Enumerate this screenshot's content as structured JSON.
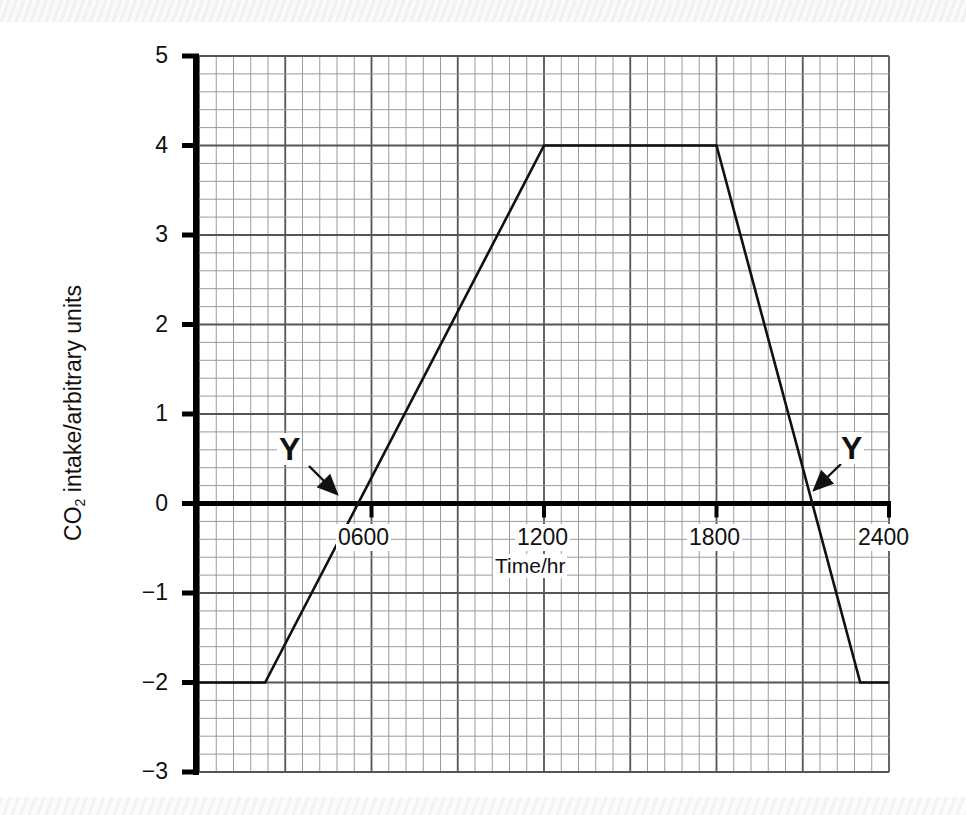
{
  "chart_data": {
    "type": "line",
    "title": "",
    "xlabel": "Time/hr",
    "ylabel": "CO2 intake/arbitrary units",
    "ylabel_main": "CO",
    "ylabel_sub": "2",
    "ylabel_rest": " intake/arbitrary units",
    "x_ticks": [
      "0600",
      "1200",
      "1800",
      "2400"
    ],
    "y_ticks": [
      "5",
      "4",
      "3",
      "2",
      "1",
      "0",
      "−1",
      "−2",
      "−3"
    ],
    "xlim": [
      0,
      2400
    ],
    "ylim": [
      -3,
      5
    ],
    "grid": true,
    "grid_minor": {
      "x_step_hr": 60,
      "y_step": 0.2
    },
    "grid_major": {
      "x_step_hr": 300,
      "y_step": 1
    },
    "series": [
      {
        "name": "CO2 intake",
        "x": [
          0,
          230,
          1200,
          1800,
          2300,
          2400
        ],
        "y": [
          -2,
          -2,
          4,
          4,
          -2,
          -2
        ]
      }
    ],
    "annotations": [
      {
        "label": "Y",
        "points_to": {
          "x": 500,
          "y": 0
        },
        "description": "compensation point (morning)"
      },
      {
        "label": "Y",
        "points_to": {
          "x": 2110,
          "y": 0
        },
        "description": "compensation point (evening)"
      }
    ],
    "colors": {
      "line": "#111111",
      "grid_minor": "#9a9a9a",
      "grid_major": "#555555",
      "axis": "#000000"
    }
  },
  "labels": {
    "y_ticks": [
      "5",
      "4",
      "3",
      "2",
      "1",
      "0",
      "−1",
      "−2",
      "−3"
    ],
    "x_ticks": [
      "0600",
      "1200",
      "1800",
      "2400"
    ],
    "xlabel": "Time/hr",
    "ylabel_main": "CO",
    "ylabel_sub": "2",
    "ylabel_rest": " intake/arbitrary units",
    "annotation_left": "Y",
    "annotation_right": "Y"
  }
}
